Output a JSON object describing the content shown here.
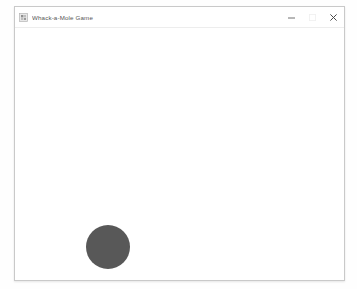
{
  "window": {
    "title": "Whack-a-Mole Game",
    "icon": "app-icon",
    "frame": {
      "x": 14,
      "y": 6,
      "width": 331,
      "height": 275,
      "border_color": "#c9c9c9",
      "background": "#ffffff"
    },
    "controls": {
      "minimize": {
        "label": "Minimize",
        "icon": "minimize-icon",
        "glyph": "—"
      },
      "maximize": {
        "label": "Maximize",
        "icon": "maximize-icon",
        "glyph": "□"
      },
      "close": {
        "label": "Close",
        "icon": "close-icon",
        "glyph": "✕"
      }
    }
  },
  "desktop": {
    "background": "#fefefe"
  },
  "game": {
    "background": "#ffffff",
    "mole": {
      "name": "mole",
      "visible": true,
      "color": "#585858",
      "diameter": 44,
      "center_x": 93,
      "center_y": 219,
      "left": 71,
      "top": 197
    }
  }
}
